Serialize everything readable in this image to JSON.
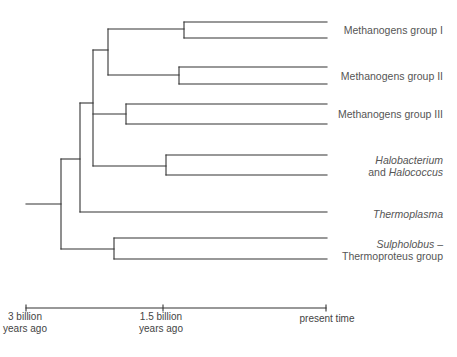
{
  "diagram": {
    "type": "phylogenetic-tree",
    "line_color": "#333333",
    "label_color": "#555555",
    "taxa": [
      {
        "id": "meth1",
        "label": "Methanogens group I",
        "italic": false
      },
      {
        "id": "meth2",
        "label": "Methanogens group II",
        "italic": false
      },
      {
        "id": "meth3",
        "label": "Methanogens group III",
        "italic": false
      },
      {
        "id": "halo",
        "line1_italic": "Halobacterium",
        "line2_prefix": "and ",
        "line2_italic": "Halococcus"
      },
      {
        "id": "thermoplasma",
        "label": "Thermoplasma",
        "italic": true
      },
      {
        "id": "sulpho",
        "line1_italic": "Sulpholobus",
        "line1_suffix": " –",
        "line2": "Thermoproteus group"
      }
    ],
    "time_axis": {
      "ticks": [
        {
          "line1": "3 billion",
          "line2": "years ago"
        },
        {
          "line1": "1.5 billion",
          "line2": "years ago"
        },
        {
          "line1": "present time",
          "line2": ""
        }
      ]
    }
  }
}
